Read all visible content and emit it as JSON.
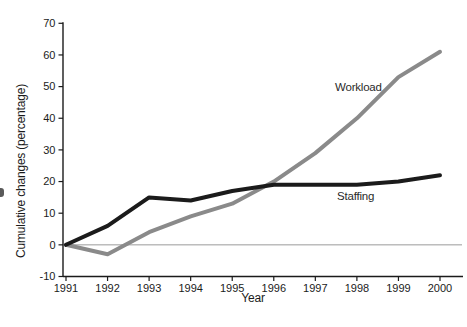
{
  "chart_data": {
    "type": "line",
    "x": [
      1991,
      1992,
      1993,
      1994,
      1995,
      1996,
      1997,
      1998,
      1999,
      2000
    ],
    "series": [
      {
        "name": "Workload",
        "color": "#8a8a8a",
        "values": [
          0,
          -3,
          4,
          9,
          13,
          20,
          29,
          40,
          53,
          61
        ]
      },
      {
        "name": "Staffing",
        "color": "#1b1b1b",
        "values": [
          0,
          6,
          15,
          14,
          17,
          19,
          19,
          19,
          20,
          22
        ]
      }
    ],
    "title": "",
    "xlabel": "Year",
    "ylabel": "Cumulative changes (percentage)",
    "ylim": [
      -10,
      70
    ],
    "yticks": [
      -10,
      0,
      10,
      20,
      30,
      40,
      50,
      60,
      70
    ],
    "grid": false,
    "zero_reference_line": true,
    "legend": "inline-labels-near-lines",
    "axis_color": "#1b1b1b",
    "zero_line_color": "#9a9a9a",
    "tick_label_color": "#1b1b1b"
  }
}
